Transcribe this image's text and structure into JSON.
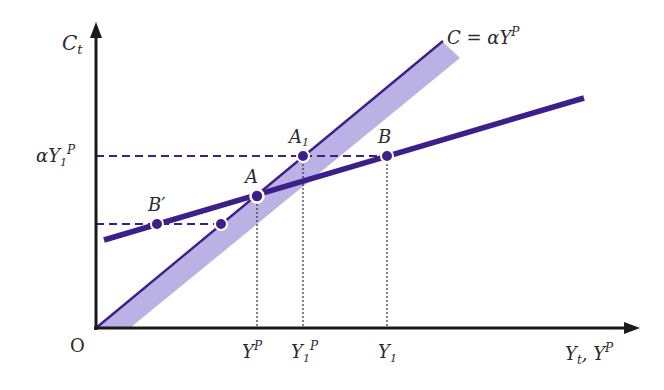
{
  "diagram": {
    "axes": {
      "y_label": "C",
      "y_label_sub": "t",
      "x_label_1": "Y",
      "x_label_1_sub": "t",
      "x_label_sep": ", ",
      "x_label_2": "Y",
      "x_label_2_sup": "P",
      "origin": "O"
    },
    "long_run_line": {
      "label_prefix": "C = αY",
      "label_sup": "P"
    },
    "y_ticks": {
      "alpha_y1p": {
        "prefix": "αY",
        "sub": "1",
        "sup": "P"
      }
    },
    "x_ticks": {
      "yp": {
        "base": "Y",
        "sup": "P"
      },
      "y1p": {
        "base": "Y",
        "sub": "1",
        "sup": "P"
      },
      "y1": {
        "base": "Y",
        "sub": "1"
      }
    },
    "points": {
      "A": "A",
      "A1": {
        "base": "A",
        "sub": "1"
      },
      "B": "B",
      "Bprime": "B′"
    },
    "colors": {
      "line": "#3d1f8a",
      "band": "#b6aee3",
      "axis": "#1a1a1a"
    }
  }
}
